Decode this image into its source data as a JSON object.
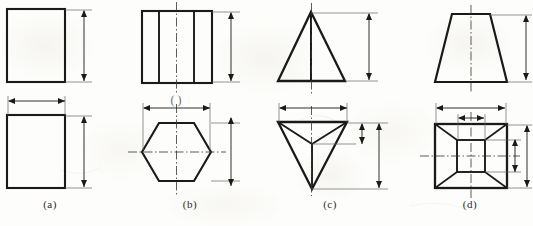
{
  "figure": {
    "type": "orthographic-projection-drawing",
    "background_color": "#fdfdfb",
    "line_color": "#1a1a1a",
    "thin_line_color": "#555555",
    "centerline_color": "#333333",
    "width": 533,
    "height": 226
  },
  "panels": [
    {
      "id": "a",
      "caption": "(a)",
      "solid_name": "rectangular-prism",
      "front_view": {
        "shape": "rectangle",
        "x": 7,
        "y": 9,
        "width": 58,
        "height": 73
      },
      "top_view": {
        "shape": "rectangle",
        "x": 7,
        "y": 115,
        "width": 58,
        "height": 73
      },
      "dimensions": [
        {
          "name": "front-height",
          "orientation": "vertical",
          "x": 84,
          "y1": 11,
          "y2": 81
        },
        {
          "name": "top-width",
          "orientation": "horizontal",
          "y": 101,
          "x1": 9,
          "x2": 65
        },
        {
          "name": "top-height",
          "orientation": "vertical",
          "x": 84,
          "y1": 117,
          "y2": 187
        }
      ]
    },
    {
      "id": "b",
      "caption": "(b)",
      "solid_name": "hexagonal-prism",
      "front_view": {
        "shape": "rectangle-with-vertical-edges",
        "x": 142,
        "y": 11,
        "width": 70,
        "height": 72,
        "inner_vertical_lines_x": [
          159,
          194
        ]
      },
      "top_view": {
        "shape": "hexagon",
        "cx": 176.5,
        "cy": 152,
        "rx": 34,
        "ry": 36
      },
      "centerlines": [
        {
          "name": "front-vertical-centerline",
          "orientation": "vertical",
          "x": 176.5,
          "y1": 2,
          "y2": 95
        },
        {
          "name": "top-vertical-centerline",
          "orientation": "vertical",
          "x": 176.5,
          "y1": 104,
          "y2": 196
        },
        {
          "name": "top-horizontal-centerline",
          "orientation": "horizontal",
          "y": 152,
          "x1": 128,
          "x2": 226
        }
      ],
      "dimensions": [
        {
          "name": "front-height",
          "orientation": "vertical",
          "x": 231,
          "y1": 13,
          "y2": 81
        },
        {
          "name": "top-across-flats",
          "orientation": "horizontal",
          "y": 108,
          "x1": 144,
          "x2": 210
        },
        {
          "name": "top-height",
          "orientation": "vertical",
          "x": 231,
          "y1": 118,
          "y2": 186
        }
      ]
    },
    {
      "id": "c",
      "caption": "(c)",
      "solid_name": "triangular-pyramid",
      "front_view": {
        "shape": "triangle",
        "apex_x": 311,
        "apex_y": 12,
        "base_left_x": 278,
        "base_right_x": 345,
        "base_y": 81
      },
      "top_view": {
        "shape": "inverted-triangle-with-internal-edges",
        "top_left_x": 278,
        "top_right_x": 347,
        "top_y": 122,
        "apex_x": 312,
        "apex_y": 189,
        "interior_node_x": 312,
        "interior_node_y": 144
      },
      "centerlines": [
        {
          "name": "front-vertical-centerline",
          "orientation": "vertical",
          "x": 311.5,
          "y1": 3,
          "y2": 94
        },
        {
          "name": "top-vertical-centerline",
          "orientation": "vertical",
          "x": 311.5,
          "y1": 106,
          "y2": 196
        }
      ],
      "dimensions": [
        {
          "name": "front-height",
          "orientation": "vertical",
          "x": 369,
          "y1": 14,
          "y2": 80
        },
        {
          "name": "top-width",
          "orientation": "horizontal",
          "y": 108,
          "x1": 280,
          "x2": 347
        },
        {
          "name": "top-inner-height",
          "orientation": "vertical",
          "x": 362,
          "y1": 124,
          "y2": 144
        },
        {
          "name": "top-overall-height",
          "orientation": "vertical",
          "x": 379,
          "y1": 124,
          "y2": 188
        }
      ]
    },
    {
      "id": "d",
      "caption": "(d)",
      "solid_name": "truncated-pyramid-frustum",
      "front_view": {
        "shape": "trapezoid",
        "top_left_x": 452,
        "top_right_x": 490,
        "top_y": 14,
        "bottom_left_x": 435,
        "bottom_right_x": 507,
        "bottom_y": 82
      },
      "top_view": {
        "shape": "nested-rectangles-with-corner-diagonals",
        "outer_x": 435,
        "outer_y": 124,
        "outer_width": 72,
        "outer_height": 64,
        "inner_x": 457,
        "inner_y": 140,
        "inner_width": 28,
        "inner_height": 32
      },
      "centerlines": [
        {
          "name": "front-vertical-centerline",
          "orientation": "vertical",
          "x": 471,
          "y1": 5,
          "y2": 94
        },
        {
          "name": "top-vertical-centerline",
          "orientation": "vertical",
          "x": 471,
          "y1": 112,
          "y2": 198
        },
        {
          "name": "top-horizontal-centerline",
          "orientation": "horizontal",
          "y": 156,
          "x1": 420,
          "x2": 520
        }
      ],
      "dimensions": [
        {
          "name": "front-height",
          "orientation": "vertical",
          "x": 526,
          "y1": 16,
          "y2": 80
        },
        {
          "name": "top-outer-width",
          "orientation": "horizontal",
          "y": 108,
          "x1": 437,
          "x2": 505
        },
        {
          "name": "top-inner-width",
          "orientation": "horizontal",
          "y": 118,
          "x1": 459,
          "x2": 484
        },
        {
          "name": "top-inner-height",
          "orientation": "vertical",
          "x": 515,
          "y1": 140,
          "y2": 172
        },
        {
          "name": "top-outer-height",
          "orientation": "vertical",
          "x": 527,
          "y1": 126,
          "y2": 187
        }
      ]
    }
  ],
  "annotations": {
    "b_top_mark": "( )"
  }
}
